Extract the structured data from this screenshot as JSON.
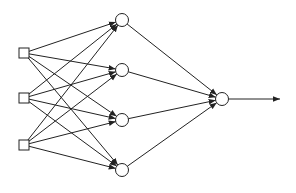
{
  "diagram": {
    "type": "feedforward-neural-network",
    "colors": {
      "stroke": "#222222",
      "fill": "#ffffff",
      "background": "#ffffff"
    },
    "layers": [
      {
        "name": "input",
        "shape": "square",
        "nodes": [
          {
            "x": 24,
            "y": 53
          },
          {
            "x": 24,
            "y": 98
          },
          {
            "x": 24,
            "y": 145
          }
        ]
      },
      {
        "name": "hidden",
        "shape": "circle",
        "nodes": [
          {
            "x": 122,
            "y": 20
          },
          {
            "x": 122,
            "y": 70
          },
          {
            "x": 122,
            "y": 120
          },
          {
            "x": 122,
            "y": 170
          }
        ]
      },
      {
        "name": "output",
        "shape": "circle",
        "nodes": [
          {
            "x": 222,
            "y": 99
          }
        ]
      }
    ],
    "output_arrow": {
      "from": {
        "x": 229,
        "y": 99
      },
      "to": {
        "x": 280,
        "y": 99
      }
    }
  }
}
